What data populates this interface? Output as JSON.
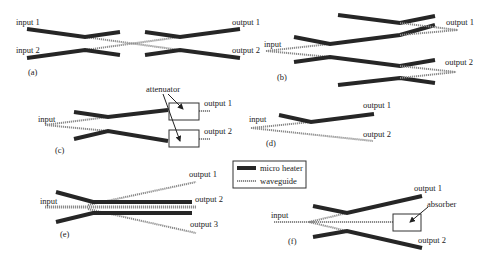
{
  "legend": {
    "micro_heater": "micro heater",
    "waveguide": "waveguide"
  },
  "panels": {
    "a": {
      "tag": "(a)",
      "input1": "input 1",
      "input2": "input 2",
      "output1": "output 1",
      "output2": "output 2"
    },
    "b": {
      "tag": "(b)",
      "input": "input",
      "output1": "output 1",
      "output2": "output 2"
    },
    "c": {
      "tag": "(c)",
      "input": "input",
      "output1": "output 1",
      "output2": "output 2",
      "attenuator": "attenuator"
    },
    "d": {
      "tag": "(d)",
      "input": "input",
      "output1": "output 1",
      "output2": "output 2"
    },
    "e": {
      "tag": "(e)",
      "input": "input",
      "output1": "output 1",
      "output2": "output 2",
      "output3": "output 3"
    },
    "f": {
      "tag": "(f)",
      "input": "input",
      "output1": "output 1",
      "output2": "output 2",
      "absorber": "absorber"
    }
  },
  "colors": {
    "heater": "#262626",
    "waveguide": "#8a8a8a"
  }
}
